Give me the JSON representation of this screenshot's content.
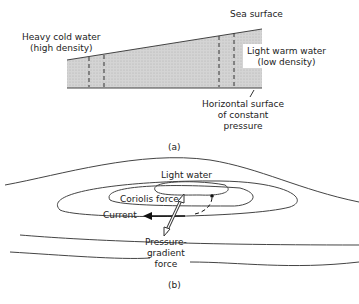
{
  "figure_a": {
    "caption": "(a)",
    "labels": {
      "heavy_line1": "Heavy cold water",
      "heavy_line2": "(high density)",
      "sea_surface": "Sea surface",
      "light_line1": "Light warm water",
      "light_line2": "(low density)",
      "horizontal_line1": "Horizontal surface",
      "horizontal_line2": "of constant",
      "horizontal_line3": "pressure"
    }
  },
  "figure_b": {
    "caption": "(b)",
    "labels": {
      "light_water": "Light water",
      "coriolis": "Coriolis force",
      "current": "Current",
      "pressure_line1": "Pressure-",
      "pressure_line2": "gradient",
      "pressure_line3": "force"
    }
  }
}
